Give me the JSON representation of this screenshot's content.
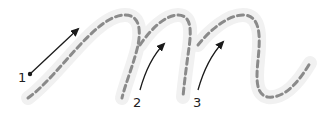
{
  "diagram": {
    "colors": {
      "glow": "#f1f1f1",
      "dashed_path": "#8a8a8a",
      "arrow": "#1a1a1a",
      "label": "#222222"
    },
    "strokes": [
      {
        "number": "1",
        "label": "1"
      },
      {
        "number": "2",
        "label": "2"
      },
      {
        "number": "3",
        "label": "3"
      }
    ]
  }
}
